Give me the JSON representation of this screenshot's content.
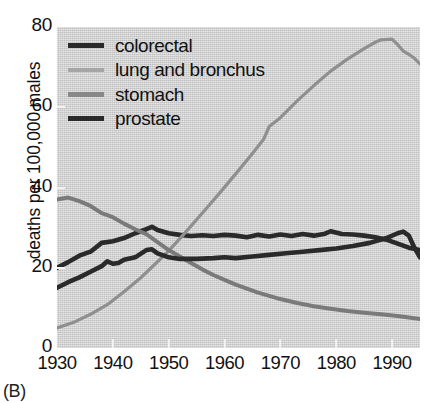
{
  "figure": {
    "panel_label": "(B)",
    "background": "#ffffff",
    "plot_background": "#cdcdcd"
  },
  "chart_data": {
    "type": "line",
    "title": "",
    "subtitle": "",
    "xlabel": "",
    "ylabel": "deaths per 100,000 males",
    "xlim": [
      1930,
      1995
    ],
    "ylim": [
      0,
      80
    ],
    "xticks": [
      1930,
      1940,
      1950,
      1960,
      1970,
      1980,
      1990
    ],
    "yticks": [
      0,
      20,
      40,
      60,
      80
    ],
    "xtick_labels": [
      "1930",
      "1940",
      "1950",
      "1960",
      "1970",
      "1980",
      "1990"
    ],
    "ytick_labels": [
      "0",
      "20",
      "40",
      "60",
      "80"
    ],
    "grid": false,
    "legend_position": "top-left",
    "x": [
      1930,
      1935,
      1940,
      1945,
      1950,
      1955,
      1960,
      1965,
      1970,
      1975,
      1980,
      1985,
      1990,
      1995
    ],
    "series": [
      {
        "name": "colorectal",
        "color": "#2a2a2a",
        "width": 4.6,
        "values": [
          20.0,
          23.5,
          26.5,
          29.5,
          28.5,
          28.0,
          28.2,
          27.8,
          28.0,
          28.2,
          28.8,
          28.0,
          27.0,
          25.5
        ],
        "points": [
          [
            1930,
            20.0
          ],
          [
            1932,
            21.4
          ],
          [
            1934,
            23.0
          ],
          [
            1936,
            24.0
          ],
          [
            1938,
            26.2
          ],
          [
            1940,
            26.6
          ],
          [
            1942,
            27.4
          ],
          [
            1944,
            28.6
          ],
          [
            1946,
            29.6
          ],
          [
            1947,
            30.2
          ],
          [
            1948,
            29.4
          ],
          [
            1950,
            28.6
          ],
          [
            1952,
            28.2
          ],
          [
            1954,
            27.9
          ],
          [
            1956,
            28.1
          ],
          [
            1958,
            27.9
          ],
          [
            1960,
            28.2
          ],
          [
            1962,
            28.0
          ],
          [
            1964,
            27.6
          ],
          [
            1966,
            28.2
          ],
          [
            1968,
            27.8
          ],
          [
            1970,
            28.3
          ],
          [
            1972,
            27.9
          ],
          [
            1974,
            28.4
          ],
          [
            1976,
            28.0
          ],
          [
            1978,
            28.5
          ],
          [
            1979,
            29.1
          ],
          [
            1981,
            28.4
          ],
          [
            1983,
            28.3
          ],
          [
            1985,
            28.0
          ],
          [
            1987,
            27.6
          ],
          [
            1989,
            27.0
          ],
          [
            1991,
            26.0
          ],
          [
            1993,
            25.0
          ],
          [
            1995,
            24.4
          ]
        ]
      },
      {
        "name": "lung and bronchus",
        "color": "#8f8f8f",
        "width": 3.2,
        "values": [
          5.0,
          7.5,
          11.0,
          16.0,
          24.0,
          34.0,
          42.5,
          51.0,
          58.5,
          66.0,
          71.5,
          75.0,
          77.0,
          71.0
        ],
        "points": [
          [
            1930,
            5.0
          ],
          [
            1933,
            6.4
          ],
          [
            1936,
            8.4
          ],
          [
            1939,
            10.8
          ],
          [
            1942,
            14.0
          ],
          [
            1945,
            17.5
          ],
          [
            1948,
            21.5
          ],
          [
            1950,
            24.2
          ],
          [
            1953,
            28.8
          ],
          [
            1956,
            33.6
          ],
          [
            1959,
            38.4
          ],
          [
            1962,
            43.4
          ],
          [
            1965,
            48.5
          ],
          [
            1967,
            52.0
          ],
          [
            1968,
            55.2
          ],
          [
            1970,
            57.4
          ],
          [
            1973,
            61.6
          ],
          [
            1976,
            65.4
          ],
          [
            1979,
            69.0
          ],
          [
            1982,
            72.0
          ],
          [
            1985,
            74.6
          ],
          [
            1987,
            76.2
          ],
          [
            1988,
            76.8
          ],
          [
            1990,
            77.0
          ],
          [
            1991,
            75.6
          ],
          [
            1992,
            74.0
          ],
          [
            1993,
            73.2
          ],
          [
            1994,
            72.2
          ],
          [
            1995,
            70.8
          ]
        ]
      },
      {
        "name": "stomach",
        "color": "#7a7a7a",
        "width": 4.0,
        "values": [
          37.0,
          36.0,
          33.0,
          29.0,
          24.0,
          20.5,
          17.5,
          15.0,
          13.0,
          11.5,
          10.0,
          9.2,
          8.4,
          7.4
        ],
        "points": [
          [
            1930,
            37.0
          ],
          [
            1932,
            37.5
          ],
          [
            1934,
            36.6
          ],
          [
            1936,
            35.4
          ],
          [
            1938,
            33.6
          ],
          [
            1940,
            32.6
          ],
          [
            1942,
            31.0
          ],
          [
            1944,
            29.6
          ],
          [
            1946,
            28.4
          ],
          [
            1948,
            26.4
          ],
          [
            1950,
            24.4
          ],
          [
            1952,
            22.8
          ],
          [
            1954,
            21.2
          ],
          [
            1956,
            19.6
          ],
          [
            1958,
            18.2
          ],
          [
            1960,
            17.0
          ],
          [
            1962,
            15.8
          ],
          [
            1964,
            14.8
          ],
          [
            1966,
            13.8
          ],
          [
            1968,
            13.0
          ],
          [
            1970,
            12.2
          ],
          [
            1973,
            11.2
          ],
          [
            1976,
            10.4
          ],
          [
            1979,
            9.8
          ],
          [
            1982,
            9.2
          ],
          [
            1985,
            8.8
          ],
          [
            1988,
            8.4
          ],
          [
            1991,
            8.0
          ],
          [
            1993,
            7.6
          ],
          [
            1995,
            7.2
          ]
        ]
      },
      {
        "name": "prostate",
        "color": "#2a2a2a",
        "width": 4.6,
        "values": [
          15.0,
          17.5,
          20.5,
          22.5,
          23.0,
          22.2,
          22.3,
          22.6,
          23.2,
          23.8,
          24.6,
          25.6,
          27.5,
          26.0
        ],
        "points": [
          [
            1930,
            15.0
          ],
          [
            1932,
            16.4
          ],
          [
            1934,
            17.6
          ],
          [
            1936,
            19.0
          ],
          [
            1938,
            20.4
          ],
          [
            1939,
            21.6
          ],
          [
            1940,
            21.0
          ],
          [
            1941,
            21.2
          ],
          [
            1942,
            22.0
          ],
          [
            1944,
            22.6
          ],
          [
            1946,
            24.4
          ],
          [
            1947,
            24.6
          ],
          [
            1948,
            23.6
          ],
          [
            1950,
            22.6
          ],
          [
            1952,
            22.2
          ],
          [
            1955,
            22.2
          ],
          [
            1958,
            22.4
          ],
          [
            1960,
            22.6
          ],
          [
            1962,
            22.4
          ],
          [
            1965,
            22.8
          ],
          [
            1968,
            23.2
          ],
          [
            1971,
            23.6
          ],
          [
            1974,
            24.0
          ],
          [
            1977,
            24.4
          ],
          [
            1980,
            24.8
          ],
          [
            1983,
            25.4
          ],
          [
            1986,
            26.2
          ],
          [
            1989,
            27.4
          ],
          [
            1991,
            28.6
          ],
          [
            1992,
            29.0
          ],
          [
            1993,
            28.0
          ],
          [
            1994,
            25.0
          ],
          [
            1995,
            22.6
          ]
        ]
      }
    ]
  },
  "legend": {
    "items": [
      {
        "label": "colorectal",
        "color": "#2a2a2a",
        "thickness": 5
      },
      {
        "label": "lung and bronchus",
        "color": "#a6a6a6",
        "thickness": 4
      },
      {
        "label": "stomach",
        "color": "#888888",
        "thickness": 5
      },
      {
        "label": "prostate",
        "color": "#2a2a2a",
        "thickness": 5
      }
    ]
  }
}
